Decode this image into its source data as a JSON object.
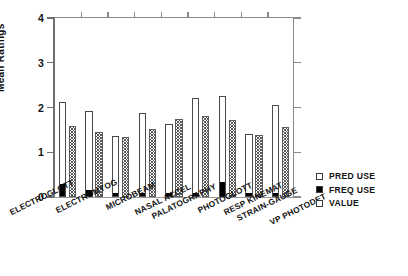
{
  "chart_data": {
    "type": "bar",
    "title": "",
    "xlabel": "",
    "ylabel": "Mean Ratings",
    "ylim": [
      0,
      4
    ],
    "yticks": [
      0,
      1,
      2,
      3,
      4
    ],
    "ytick_labels": [
      "0",
      "1",
      "2",
      "3",
      "4"
    ],
    "grid": false,
    "legend_position": "right",
    "categories": [
      "ELECTROGLOTT",
      "ELECTROMYOG",
      "MICROBEAM",
      "NASAL ACCEL",
      "PALATOGRAPHY",
      "PHOTOGLOTT",
      "RESP KINEMAT",
      "STRAIN-GAUGE",
      "VP PHOTODET"
    ],
    "series": [
      {
        "name": "PRED USE",
        "values": [
          2.12,
          1.93,
          1.37,
          1.87,
          1.63,
          2.22,
          2.26,
          1.4,
          2.05
        ]
      },
      {
        "name": "FREQ USE",
        "values": [
          0.26,
          0.14,
          0.06,
          0.06,
          0.06,
          0.06,
          0.32,
          0.06,
          0.06
        ]
      },
      {
        "name": "VALUE",
        "values": [
          1.59,
          1.46,
          1.35,
          1.52,
          1.74,
          1.8,
          1.72,
          1.38,
          1.57
        ]
      }
    ]
  },
  "legend": {
    "items": [
      {
        "label": "PRED USE",
        "swatch": "open"
      },
      {
        "label": "FREQ USE",
        "swatch": "filled"
      },
      {
        "label": "VALUE",
        "swatch": "open"
      }
    ]
  },
  "caption": ""
}
